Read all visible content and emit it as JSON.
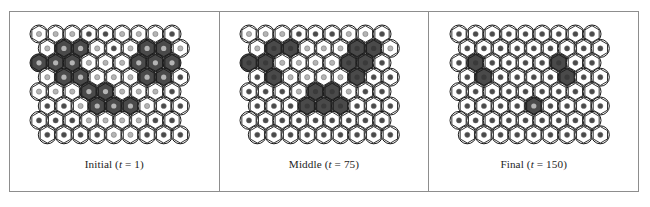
{
  "figure": {
    "type": "hexagonal-lattice-state-panels",
    "background_color": "#ffffff",
    "frame_color": "#8d8d8d",
    "panel_count": 3
  },
  "style": {
    "cell_outline_color": "#1a1a1a",
    "cell_empty_fill": "#ffffff",
    "cell_active_fill": "#4a4a4a",
    "dot_light_color": "#b4b4b4",
    "dot_dark_color": "#4a4a4a",
    "hex_radius": 9.6,
    "circle_radius": 9.0,
    "dot_radius": 2.6,
    "columns": 9,
    "rows": 8
  },
  "panels": [
    {
      "id": "panel-initial",
      "name": "Initial",
      "time_label": "t",
      "time_value": "1",
      "caption_prefix": "Initial (",
      "caption_suffix": " = 1)",
      "active_cells": [
        [
          1,
          1
        ],
        [
          1,
          2
        ],
        [
          1,
          6
        ],
        [
          1,
          7
        ],
        [
          2,
          0
        ],
        [
          2,
          1
        ],
        [
          2,
          2
        ],
        [
          2,
          6
        ],
        [
          2,
          7
        ],
        [
          2,
          8
        ],
        [
          3,
          1
        ],
        [
          3,
          2
        ],
        [
          3,
          6
        ],
        [
          3,
          7
        ],
        [
          4,
          3
        ],
        [
          4,
          4
        ],
        [
          5,
          3
        ],
        [
          5,
          4
        ],
        [
          5,
          5
        ]
      ],
      "dark_dots": [
        [
          0,
          3
        ],
        [
          0,
          4
        ],
        [
          0,
          8
        ],
        [
          1,
          4
        ],
        [
          3,
          8
        ],
        [
          4,
          8
        ],
        [
          5,
          0
        ],
        [
          5,
          1
        ],
        [
          5,
          7
        ],
        [
          5,
          8
        ],
        [
          6,
          0
        ],
        [
          6,
          1
        ],
        [
          6,
          2
        ],
        [
          6,
          7
        ],
        [
          6,
          8
        ],
        [
          7,
          0
        ],
        [
          7,
          1
        ],
        [
          7,
          2
        ],
        [
          7,
          3
        ],
        [
          7,
          6
        ],
        [
          7,
          7
        ],
        [
          7,
          8
        ]
      ]
    },
    {
      "id": "panel-middle",
      "name": "Middle",
      "time_label": "t",
      "time_value": "75",
      "caption_prefix": "Middle (",
      "caption_suffix": " = 75)",
      "active_cells": [
        [
          1,
          1
        ],
        [
          1,
          2
        ],
        [
          1,
          6
        ],
        [
          1,
          7
        ],
        [
          2,
          0
        ],
        [
          2,
          1
        ],
        [
          2,
          6
        ],
        [
          2,
          7
        ],
        [
          3,
          1
        ],
        [
          3,
          6
        ],
        [
          4,
          4
        ],
        [
          4,
          5
        ],
        [
          5,
          3
        ],
        [
          5,
          4
        ],
        [
          5,
          5
        ]
      ],
      "dark_dots": [
        [
          0,
          3
        ],
        [
          0,
          4
        ],
        [
          0,
          5
        ],
        [
          0,
          8
        ],
        [
          1,
          1
        ],
        [
          1,
          2
        ],
        [
          1,
          6
        ],
        [
          1,
          7
        ],
        [
          2,
          0
        ],
        [
          2,
          1
        ],
        [
          2,
          6
        ],
        [
          2,
          7
        ],
        [
          2,
          8
        ],
        [
          3,
          0
        ],
        [
          3,
          1
        ],
        [
          3,
          6
        ],
        [
          3,
          7
        ],
        [
          3,
          8
        ],
        [
          4,
          0
        ],
        [
          4,
          1
        ],
        [
          4,
          2
        ],
        [
          4,
          4
        ],
        [
          4,
          5
        ],
        [
          4,
          7
        ],
        [
          4,
          8
        ],
        [
          5,
          0
        ],
        [
          5,
          1
        ],
        [
          5,
          2
        ],
        [
          5,
          3
        ],
        [
          5,
          4
        ],
        [
          5,
          5
        ],
        [
          5,
          6
        ],
        [
          5,
          7
        ],
        [
          5,
          8
        ],
        [
          6,
          0
        ],
        [
          6,
          1
        ],
        [
          6,
          2
        ],
        [
          6,
          3
        ],
        [
          6,
          4
        ],
        [
          6,
          5
        ],
        [
          6,
          6
        ],
        [
          6,
          7
        ],
        [
          6,
          8
        ],
        [
          7,
          0
        ],
        [
          7,
          1
        ],
        [
          7,
          2
        ],
        [
          7,
          3
        ],
        [
          7,
          4
        ],
        [
          7,
          5
        ],
        [
          7,
          6
        ],
        [
          7,
          7
        ],
        [
          7,
          8
        ]
      ]
    },
    {
      "id": "panel-final",
      "name": "Final",
      "time_label": "t",
      "time_value": "150",
      "caption_prefix": "Final (",
      "caption_suffix": " = 150)",
      "active_cells": [
        [
          2,
          1
        ],
        [
          2,
          6
        ],
        [
          3,
          1
        ],
        [
          3,
          6
        ],
        [
          5,
          4
        ]
      ],
      "dark_dots": [
        [
          0,
          0
        ],
        [
          0,
          1
        ],
        [
          0,
          2
        ],
        [
          0,
          3
        ],
        [
          0,
          4
        ],
        [
          0,
          5
        ],
        [
          0,
          6
        ],
        [
          0,
          7
        ],
        [
          0,
          8
        ],
        [
          1,
          0
        ],
        [
          1,
          1
        ],
        [
          1,
          2
        ],
        [
          1,
          3
        ],
        [
          1,
          4
        ],
        [
          1,
          5
        ],
        [
          1,
          6
        ],
        [
          1,
          7
        ],
        [
          1,
          8
        ],
        [
          2,
          0
        ],
        [
          2,
          1
        ],
        [
          2,
          2
        ],
        [
          2,
          3
        ],
        [
          2,
          4
        ],
        [
          2,
          5
        ],
        [
          2,
          6
        ],
        [
          2,
          7
        ],
        [
          2,
          8
        ],
        [
          3,
          0
        ],
        [
          3,
          1
        ],
        [
          3,
          2
        ],
        [
          3,
          3
        ],
        [
          3,
          4
        ],
        [
          3,
          5
        ],
        [
          3,
          6
        ],
        [
          3,
          7
        ],
        [
          3,
          8
        ],
        [
          4,
          0
        ],
        [
          4,
          1
        ],
        [
          4,
          2
        ],
        [
          4,
          3
        ],
        [
          4,
          4
        ],
        [
          4,
          5
        ],
        [
          4,
          6
        ],
        [
          4,
          7
        ],
        [
          4,
          8
        ],
        [
          5,
          0
        ],
        [
          5,
          1
        ],
        [
          5,
          2
        ],
        [
          5,
          3
        ],
        [
          5,
          5
        ],
        [
          5,
          6
        ],
        [
          5,
          7
        ],
        [
          5,
          8
        ],
        [
          6,
          0
        ],
        [
          6,
          1
        ],
        [
          6,
          2
        ],
        [
          6,
          3
        ],
        [
          6,
          4
        ],
        [
          6,
          5
        ],
        [
          6,
          6
        ],
        [
          6,
          7
        ],
        [
          6,
          8
        ],
        [
          7,
          0
        ],
        [
          7,
          1
        ],
        [
          7,
          2
        ],
        [
          7,
          3
        ],
        [
          7,
          4
        ],
        [
          7,
          5
        ],
        [
          7,
          6
        ],
        [
          7,
          7
        ],
        [
          7,
          8
        ]
      ]
    }
  ]
}
